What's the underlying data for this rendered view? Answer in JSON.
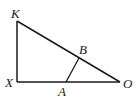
{
  "diagram": {
    "type": "geometry-triangle",
    "points": {
      "K": {
        "label": "K",
        "x": 17,
        "y": 21
      },
      "X": {
        "label": "X",
        "x": 17,
        "y": 82
      },
      "O": {
        "label": "O",
        "x": 120,
        "y": 82
      },
      "A": {
        "label": "A",
        "x": 66,
        "y": 82
      },
      "B": {
        "label": "B",
        "x": 79,
        "y": 58
      }
    },
    "segments": [
      "KX",
      "XO",
      "KO",
      "AB"
    ],
    "stroke_color": "#1a1a1a"
  }
}
